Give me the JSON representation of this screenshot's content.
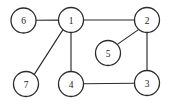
{
  "figure": {
    "width": 176,
    "height": 106,
    "background_color": "#ffffff",
    "stroke_color": "#2b2b2b",
    "label_color": "#1c1c1c"
  },
  "graph_data": {
    "type": "node-link-diagram",
    "directed": false,
    "weighted": false,
    "node_radius": 12.5,
    "nodes": [
      {
        "id": "6",
        "label": "6",
        "cx": 23.5,
        "cy": 20.5
      },
      {
        "id": "1",
        "label": "1",
        "cx": 71,
        "cy": 20
      },
      {
        "id": "2",
        "label": "2",
        "cx": 147,
        "cy": 20
      },
      {
        "id": "5",
        "label": "5",
        "cx": 108,
        "cy": 53
      },
      {
        "id": "7",
        "label": "7",
        "cx": 26,
        "cy": 84
      },
      {
        "id": "4",
        "label": "4",
        "cx": 71,
        "cy": 84
      },
      {
        "id": "3",
        "label": "3",
        "cx": 147,
        "cy": 83
      }
    ],
    "edges": [
      {
        "source": "6",
        "target": "1",
        "x1": 36.0,
        "y1": 20.3,
        "x2": 58.5,
        "y2": 20.1
      },
      {
        "source": "1",
        "target": "2",
        "x1": 83.5,
        "y1": 20.0,
        "x2": 134.5,
        "y2": 20.0
      },
      {
        "source": "1",
        "target": "4",
        "x1": 71.0,
        "y1": 32.5,
        "x2": 71.0,
        "y2": 71.5
      },
      {
        "source": "1",
        "target": "7",
        "x1": 63.0,
        "y1": 29.6,
        "x2": 34.3,
        "y2": 74.4
      },
      {
        "source": "2",
        "target": "3",
        "x1": 147.0,
        "y1": 32.5,
        "x2": 147.0,
        "y2": 70.5
      },
      {
        "source": "2",
        "target": "5",
        "x1": 138.8,
        "y1": 29.4,
        "x2": 117.0,
        "y2": 44.6
      },
      {
        "source": "4",
        "target": "3",
        "x1": 83.5,
        "y1": 83.8,
        "x2": 134.5,
        "y2": 83.2
      }
    ]
  }
}
